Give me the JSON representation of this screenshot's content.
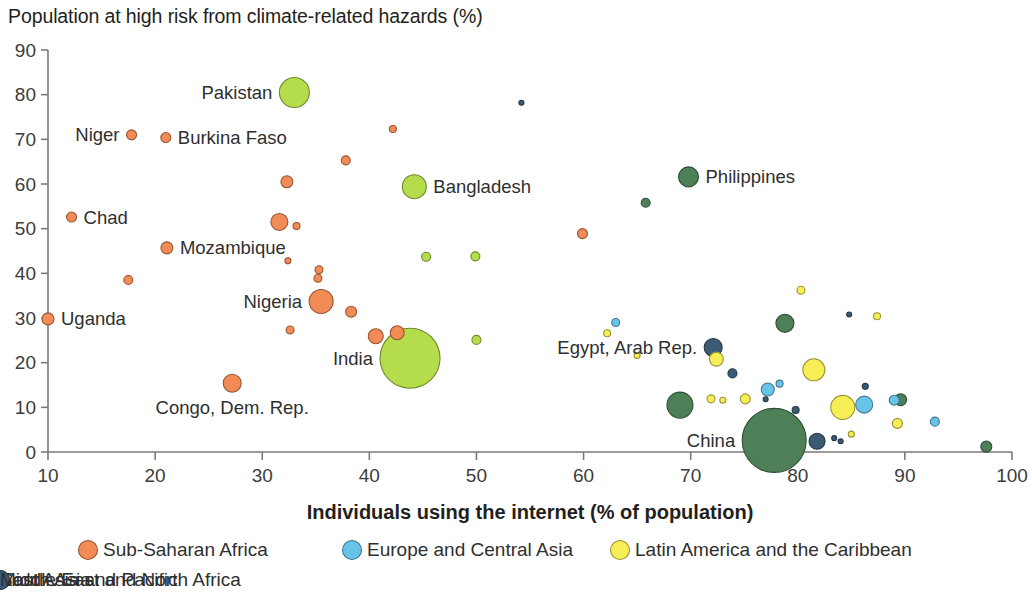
{
  "chart_data": {
    "type": "scatter",
    "title": "Population at high risk from climate-related hazards (%)",
    "xlabel": "Individuals using the internet (% of population)",
    "ylabel": "Population at high risk from climate-related hazards (%)",
    "xlim": [
      10,
      100
    ],
    "ylim": [
      0,
      90
    ],
    "xticks": [
      10,
      20,
      30,
      40,
      50,
      60,
      70,
      80,
      90,
      100
    ],
    "yticks": [
      0,
      10,
      20,
      30,
      40,
      50,
      60,
      70,
      80,
      90
    ],
    "grid": false,
    "legend_position": "bottom",
    "note": "Bubble area encodes population size; r is drawn radius in px.",
    "legend": [
      {
        "name": "Sub-Saharan Africa",
        "color": "#F28B55"
      },
      {
        "name": "Europe and Central Asia",
        "color": "#67C3E8"
      },
      {
        "name": "Latin America and the Caribbean",
        "color": "#F7EE55"
      },
      {
        "name": "East Asia and Pacific",
        "color": "#4E8058"
      },
      {
        "name": "South Asia",
        "color": "#B5DD4B"
      },
      {
        "name": "Middle East and North Africa",
        "color": "#3B5B75"
      }
    ],
    "labeled_points": [
      {
        "label": "Pakistan",
        "x": 33.0,
        "y": 80.5,
        "r": 15,
        "region": "South Asia",
        "label_side": "left"
      },
      {
        "label": "Niger",
        "x": 17.8,
        "y": 71.0,
        "r": 5,
        "region": "Sub-Saharan Africa",
        "label_side": "left"
      },
      {
        "label": "Burkina Faso",
        "x": 21.0,
        "y": 70.4,
        "r": 5,
        "region": "Sub-Saharan Africa",
        "label_side": "right"
      },
      {
        "label": "Bangladesh",
        "x": 44.2,
        "y": 59.4,
        "r": 12,
        "region": "South Asia",
        "label_side": "right"
      },
      {
        "label": "Philippines",
        "x": 69.8,
        "y": 61.6,
        "r": 10,
        "region": "East Asia and Pacific",
        "label_side": "right"
      },
      {
        "label": "Chad",
        "x": 12.2,
        "y": 52.6,
        "r": 5,
        "region": "Sub-Saharan Africa",
        "label_side": "right"
      },
      {
        "label": "Mozambique",
        "x": 21.1,
        "y": 45.7,
        "r": 6,
        "region": "Sub-Saharan Africa",
        "label_side": "right"
      },
      {
        "label": "Nigeria",
        "x": 35.5,
        "y": 33.7,
        "r": 12,
        "region": "Sub-Saharan Africa",
        "label_side": "left"
      },
      {
        "label": "Uganda",
        "x": 10.0,
        "y": 29.8,
        "r": 6,
        "region": "Sub-Saharan Africa",
        "label_side": "right"
      },
      {
        "label": "India",
        "x": 43.8,
        "y": 21.0,
        "r": 30,
        "region": "South Asia",
        "label_side": "left"
      },
      {
        "label": "Egypt, Arab Rep.",
        "x": 72.1,
        "y": 23.4,
        "r": 9,
        "region": "Middle East and North Africa",
        "label_side": "left"
      },
      {
        "label": "Congo, Dem. Rep.",
        "x": 27.2,
        "y": 15.4,
        "r": 9,
        "region": "Sub-Saharan Africa",
        "label_side": "below"
      },
      {
        "label": "China",
        "x": 77.8,
        "y": 2.6,
        "r": 32,
        "region": "East Asia and Pacific",
        "label_side": "left"
      }
    ],
    "unlabeled_points": [
      {
        "x": 54.2,
        "y": 78.2,
        "r": 2.5,
        "region": "Middle East and North Africa"
      },
      {
        "x": 42.2,
        "y": 72.3,
        "r": 3.5,
        "region": "Sub-Saharan Africa"
      },
      {
        "x": 37.8,
        "y": 65.3,
        "r": 4.5,
        "region": "Sub-Saharan Africa"
      },
      {
        "x": 32.3,
        "y": 60.5,
        "r": 6,
        "region": "Sub-Saharan Africa"
      },
      {
        "x": 65.8,
        "y": 55.8,
        "r": 4.5,
        "region": "East Asia and Pacific"
      },
      {
        "x": 31.6,
        "y": 51.5,
        "r": 8.5,
        "region": "Sub-Saharan Africa"
      },
      {
        "x": 33.2,
        "y": 50.6,
        "r": 3.5,
        "region": "Sub-Saharan Africa"
      },
      {
        "x": 59.9,
        "y": 48.9,
        "r": 5,
        "region": "Sub-Saharan Africa"
      },
      {
        "x": 49.9,
        "y": 43.8,
        "r": 4.5,
        "region": "South Asia"
      },
      {
        "x": 32.4,
        "y": 42.8,
        "r": 3,
        "region": "Sub-Saharan Africa"
      },
      {
        "x": 35.3,
        "y": 40.8,
        "r": 4,
        "region": "Sub-Saharan Africa"
      },
      {
        "x": 35.2,
        "y": 38.9,
        "r": 4,
        "region": "Sub-Saharan Africa"
      },
      {
        "x": 17.5,
        "y": 38.5,
        "r": 4.5,
        "region": "Sub-Saharan Africa"
      },
      {
        "x": 38.3,
        "y": 31.4,
        "r": 5.5,
        "region": "Sub-Saharan Africa"
      },
      {
        "x": 32.6,
        "y": 27.3,
        "r": 4,
        "region": "Sub-Saharan Africa"
      },
      {
        "x": 40.6,
        "y": 25.9,
        "r": 7.5,
        "region": "Sub-Saharan Africa"
      },
      {
        "x": 42.6,
        "y": 26.7,
        "r": 7,
        "region": "Sub-Saharan Africa"
      },
      {
        "x": 50.0,
        "y": 25.1,
        "r": 4.5,
        "region": "South Asia"
      },
      {
        "x": 45.3,
        "y": 43.7,
        "r": 4.5,
        "region": "South Asia"
      },
      {
        "x": 63.0,
        "y": 29.0,
        "r": 4,
        "region": "Europe and Central Asia"
      },
      {
        "x": 62.2,
        "y": 26.6,
        "r": 3.5,
        "region": "Latin America and the Caribbean"
      },
      {
        "x": 65.0,
        "y": 21.6,
        "r": 3,
        "region": "Latin America and the Caribbean"
      },
      {
        "x": 80.3,
        "y": 36.2,
        "r": 4,
        "region": "Latin America and the Caribbean"
      },
      {
        "x": 78.8,
        "y": 28.8,
        "r": 9,
        "region": "East Asia and Pacific"
      },
      {
        "x": 84.8,
        "y": 30.8,
        "r": 2.5,
        "region": "Middle East and North Africa"
      },
      {
        "x": 87.4,
        "y": 30.4,
        "r": 3.5,
        "region": "Latin America and the Caribbean"
      },
      {
        "x": 72.4,
        "y": 20.8,
        "r": 7,
        "region": "Latin America and the Caribbean"
      },
      {
        "x": 81.5,
        "y": 18.4,
        "r": 11,
        "region": "Latin America and the Caribbean"
      },
      {
        "x": 73.9,
        "y": 17.6,
        "r": 4.5,
        "region": "Middle East and North Africa"
      },
      {
        "x": 77.2,
        "y": 14.0,
        "r": 6.5,
        "region": "Europe and Central Asia"
      },
      {
        "x": 78.3,
        "y": 15.3,
        "r": 3.5,
        "region": "Europe and Central Asia"
      },
      {
        "x": 86.3,
        "y": 14.7,
        "r": 3,
        "region": "Middle East and North Africa"
      },
      {
        "x": 71.9,
        "y": 11.9,
        "r": 4,
        "region": "Latin America and the Caribbean"
      },
      {
        "x": 73.0,
        "y": 11.6,
        "r": 3,
        "region": "Latin America and the Caribbean"
      },
      {
        "x": 75.1,
        "y": 11.9,
        "r": 5,
        "region": "Latin America and the Caribbean"
      },
      {
        "x": 84.2,
        "y": 10.0,
        "r": 12,
        "region": "Latin America and the Caribbean"
      },
      {
        "x": 86.2,
        "y": 10.6,
        "r": 8.5,
        "region": "Europe and Central Asia"
      },
      {
        "x": 89.0,
        "y": 11.6,
        "r": 5,
        "region": "Europe and Central Asia"
      },
      {
        "x": 89.6,
        "y": 11.7,
        "r": 6,
        "region": "East Asia and Pacific"
      },
      {
        "x": 77.0,
        "y": 11.8,
        "r": 2.5,
        "region": "Middle East and North Africa"
      },
      {
        "x": 79.8,
        "y": 9.4,
        "r": 3.5,
        "region": "Middle East and North Africa"
      },
      {
        "x": 89.3,
        "y": 6.4,
        "r": 5,
        "region": "Latin America and the Caribbean"
      },
      {
        "x": 92.8,
        "y": 6.8,
        "r": 4.5,
        "region": "Europe and Central Asia"
      },
      {
        "x": 81.8,
        "y": 2.4,
        "r": 8,
        "region": "Middle East and North Africa"
      },
      {
        "x": 83.4,
        "y": 3.1,
        "r": 2.5,
        "region": "Middle East and North Africa"
      },
      {
        "x": 84.0,
        "y": 2.4,
        "r": 2.5,
        "region": "Middle East and North Africa"
      },
      {
        "x": 85.0,
        "y": 4.0,
        "r": 3,
        "region": "Latin America and the Caribbean"
      },
      {
        "x": 69.0,
        "y": 10.5,
        "r": 13,
        "region": "East Asia and Pacific"
      },
      {
        "x": 97.6,
        "y": 1.2,
        "r": 5.5,
        "region": "East Asia and Pacific"
      }
    ]
  }
}
